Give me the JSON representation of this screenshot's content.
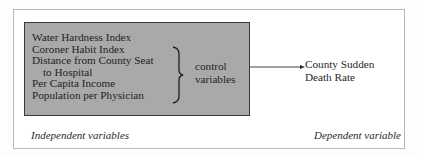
{
  "independent": {
    "variables": [
      "Water Hardness Index",
      "Coroner Habit Index",
      "Distance from County Seat",
      "to Hospital",
      "Per Capita Income",
      "Population per Physician"
    ],
    "brace_label": [
      "control",
      "variables"
    ],
    "caption": "Independent variables"
  },
  "dependent": {
    "label": [
      "County Sudden",
      "Death Rate"
    ],
    "caption": "Dependent variable"
  },
  "colors": {
    "box_fill": "#a9a9a9",
    "box_border": "#3a3a3a",
    "frame_border": "#b8b8b8"
  }
}
